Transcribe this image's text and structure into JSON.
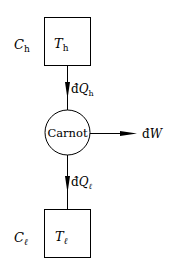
{
  "diagram": {
    "hot_reservoir": {
      "capacity_label": "C",
      "capacity_sub": "h",
      "temp_label": "T",
      "temp_sub": "h"
    },
    "cold_reservoir": {
      "capacity_label": "C",
      "capacity_sub": "ℓ",
      "temp_label": "T",
      "temp_sub": "ℓ"
    },
    "engine": {
      "label": "Carnot"
    },
    "heat_in": {
      "prefix": "đ",
      "label": "Q",
      "sub": "h"
    },
    "heat_out": {
      "prefix": "đ",
      "label": "Q",
      "sub": "ℓ"
    },
    "work": {
      "prefix": "đ",
      "label": "W"
    }
  }
}
